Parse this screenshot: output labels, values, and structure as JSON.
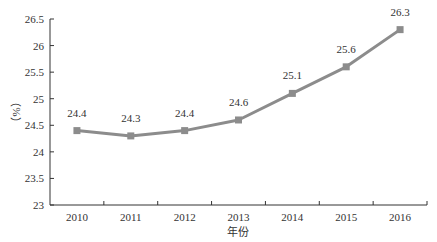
{
  "chart_data": {
    "type": "line",
    "title": "",
    "xlabel": "年份",
    "ylabel": "（%）",
    "categories": [
      "2010",
      "2011",
      "2012",
      "2013",
      "2014",
      "2015",
      "2016"
    ],
    "series": [
      {
        "name": "",
        "values": [
          24.4,
          24.3,
          24.4,
          24.6,
          25.1,
          25.6,
          26.3
        ],
        "color": "#8c8c8c",
        "marker": "square"
      }
    ],
    "data_labels": [
      "24.4",
      "24.3",
      "24.4",
      "24.6",
      "25.1",
      "25.6",
      "26.3"
    ],
    "yticks": [
      "23",
      "23.5",
      "24",
      "24.5",
      "25",
      "25.5",
      "26",
      "26.5"
    ],
    "ylim": [
      23,
      26.5
    ],
    "grid": false,
    "legend": null
  }
}
